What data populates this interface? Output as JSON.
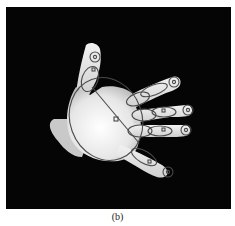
{
  "figure": {
    "caption": "(b)",
    "background_color": "#050505",
    "overlay_color": "#4a4a4a",
    "hand_color": "#e8e8e8"
  }
}
